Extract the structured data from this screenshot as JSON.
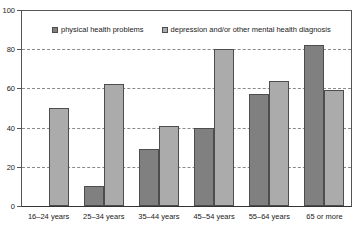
{
  "chart_data": {
    "type": "bar",
    "title": "",
    "subtitle": "",
    "xlabel": "",
    "ylabel": "",
    "ylim": [
      0,
      100
    ],
    "yticks": [
      0,
      20,
      40,
      60,
      80,
      100
    ],
    "grid": true,
    "legend_position": "top-inside",
    "categories": [
      "16–24 years",
      "25–34 years",
      "35–44 years",
      "45–54 years",
      "55–64 years",
      "65 or more"
    ],
    "series": [
      {
        "name": "physical health problems",
        "color": "#808080",
        "values": [
          0,
          10,
          29,
          40,
          57,
          82
        ]
      },
      {
        "name": "depression and/or other mental health diagnosis",
        "color": "#ababab",
        "values": [
          50,
          62,
          41,
          80,
          64,
          59
        ]
      }
    ]
  },
  "colors": {
    "series_dark": "#808080",
    "series_light": "#ababab",
    "axis": "#555555",
    "gridline": "#8a8a8a",
    "text": "#1a1a1a",
    "background": "#ffffff"
  }
}
